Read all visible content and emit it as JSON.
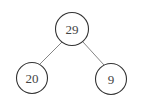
{
  "diagram": {
    "type": "binary-tree",
    "nodes": [
      {
        "id": "root",
        "label": "29",
        "cx": 72,
        "cy": 29,
        "r": 16.5
      },
      {
        "id": "left",
        "label": "20",
        "cx": 32,
        "cy": 78,
        "r": 15.5
      },
      {
        "id": "right",
        "label": "9",
        "cx": 111,
        "cy": 79,
        "r": 15.5
      }
    ],
    "edges": [
      {
        "from": "root",
        "to": "left"
      },
      {
        "from": "root",
        "to": "right"
      }
    ]
  }
}
